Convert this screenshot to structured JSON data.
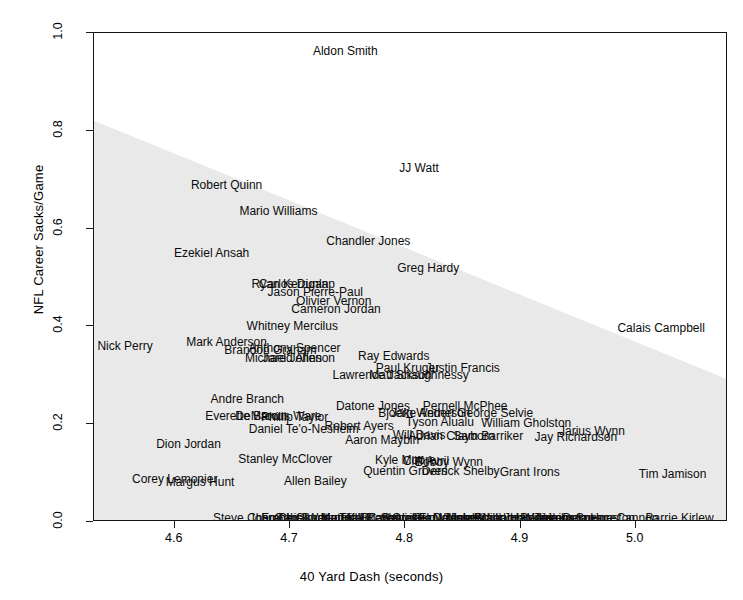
{
  "chart_data": {
    "type": "scatter",
    "title": "",
    "xlabel": "40 Yard Dash (seconds)",
    "ylabel": "NFL Career Sacks/Game",
    "xlim": [
      4.53,
      5.08
    ],
    "ylim": [
      0.0,
      1.0
    ],
    "xticks": [
      "4.6",
      "4.7",
      "4.8",
      "4.9",
      "5.0"
    ],
    "xtick_values": [
      4.6,
      4.7,
      4.8,
      4.9,
      5.0
    ],
    "yticks": [
      "0.0",
      "0.2",
      "0.4",
      "0.6",
      "0.8",
      "1.0"
    ],
    "ytick_values": [
      0.0,
      0.2,
      0.4,
      0.6,
      0.8,
      1.0
    ],
    "grid": false,
    "legend": "none",
    "marker_style": "text-labels",
    "shaded_region": {
      "description": "light grey triangular density/convex-hull shading under a descending boundary",
      "color": "#e9e9e9",
      "boundary_points": [
        [
          4.53,
          0.82
        ],
        [
          5.08,
          0.29
        ],
        [
          5.08,
          0.0
        ],
        [
          4.53,
          0.0
        ]
      ]
    },
    "points": [
      {
        "label": "Aldon Smith",
        "x": 4.748,
        "y": 0.963
      },
      {
        "label": "JJ Watt",
        "x": 4.812,
        "y": 0.723
      },
      {
        "label": "Robert Quinn",
        "x": 4.645,
        "y": 0.69
      },
      {
        "label": "Mario Williams",
        "x": 4.69,
        "y": 0.636
      },
      {
        "label": "Chandler Jones",
        "x": 4.768,
        "y": 0.575
      },
      {
        "label": "Ezekiel Ansah",
        "x": 4.632,
        "y": 0.551
      },
      {
        "label": "Greg Hardy",
        "x": 4.82,
        "y": 0.519
      },
      {
        "label": "Ryan Kerrigan",
        "x": 4.7,
        "y": 0.487
      },
      {
        "label": "Carlos Dunlap",
        "x": 4.706,
        "y": 0.487
      },
      {
        "label": "Jason Pierre-Paul",
        "x": 4.722,
        "y": 0.47
      },
      {
        "label": "Olivier Vernon",
        "x": 4.738,
        "y": 0.452
      },
      {
        "label": "Cameron Jordan",
        "x": 4.74,
        "y": 0.436
      },
      {
        "label": "Whitney Mercilus",
        "x": 4.702,
        "y": 0.4
      },
      {
        "label": "Calais Campbell",
        "x": 5.022,
        "y": 0.397
      },
      {
        "label": "Mark Anderson",
        "x": 4.645,
        "y": 0.369
      },
      {
        "label": "Nick Perry",
        "x": 4.557,
        "y": 0.36
      },
      {
        "label": "Anthony Spencer",
        "x": 4.704,
        "y": 0.356
      },
      {
        "label": "Brandon Graham",
        "x": 4.683,
        "y": 0.351
      },
      {
        "label": "Ray Edwards",
        "x": 4.79,
        "y": 0.34
      },
      {
        "label": "Michael Johnson",
        "x": 4.7,
        "y": 0.336
      },
      {
        "label": "Jared Allen",
        "x": 4.702,
        "y": 0.336
      },
      {
        "label": "Paul Kruger",
        "x": 4.802,
        "y": 0.315
      },
      {
        "label": "Justin Francis",
        "x": 4.85,
        "y": 0.315
      },
      {
        "label": "Lawrence Jackson",
        "x": 4.78,
        "y": 0.3
      },
      {
        "label": "Matt Shaughnessy",
        "x": 4.812,
        "y": 0.3
      },
      {
        "label": "Andre Branch",
        "x": 4.663,
        "y": 0.252
      },
      {
        "label": "Datone Jones",
        "x": 4.772,
        "y": 0.238
      },
      {
        "label": "Pernell McPhee",
        "x": 4.852,
        "y": 0.237
      },
      {
        "label": "Bjoern Werner",
        "x": 4.81,
        "y": 0.222
      },
      {
        "label": "Jake Anderson",
        "x": 4.822,
        "y": 0.222
      },
      {
        "label": "George Selvie",
        "x": 4.878,
        "y": 0.222
      },
      {
        "label": "Everette Brown",
        "x": 4.662,
        "y": 0.216
      },
      {
        "label": "DeMarcus Ware",
        "x": 4.69,
        "y": 0.216
      },
      {
        "label": "Phillip Taylor",
        "x": 4.704,
        "y": 0.214
      },
      {
        "label": "Tyson Alualu",
        "x": 4.83,
        "y": 0.204
      },
      {
        "label": "William Gholston",
        "x": 4.905,
        "y": 0.203
      },
      {
        "label": "Robert Ayers",
        "x": 4.76,
        "y": 0.196
      },
      {
        "label": "Daniel Te'o-Nesheim",
        "x": 4.712,
        "y": 0.19
      },
      {
        "label": "Jarius Wynn",
        "x": 4.962,
        "y": 0.186
      },
      {
        "label": "Will Davis",
        "x": 4.812,
        "y": 0.178
      },
      {
        "label": "Adrian Clayborn",
        "x": 4.84,
        "y": 0.176
      },
      {
        "label": "Sam Barriker",
        "x": 4.872,
        "y": 0.176
      },
      {
        "label": "Jay Richardson",
        "x": 4.948,
        "y": 0.174
      },
      {
        "label": "Aaron Maybin",
        "x": 4.78,
        "y": 0.168
      },
      {
        "label": "Dion Jordan",
        "x": 4.612,
        "y": 0.16
      },
      {
        "label": "Stanley McClover",
        "x": 4.696,
        "y": 0.128
      },
      {
        "label": "Kyle Moore",
        "x": 4.8,
        "y": 0.126
      },
      {
        "label": "Cliff Avril",
        "x": 4.818,
        "y": 0.124
      },
      {
        "label": "Bobby Wynn",
        "x": 4.838,
        "y": 0.122
      },
      {
        "label": "Quentin Groves",
        "x": 4.8,
        "y": 0.104
      },
      {
        "label": "Derrick Shelby",
        "x": 4.848,
        "y": 0.104
      },
      {
        "label": "Grant Irons",
        "x": 4.908,
        "y": 0.102
      },
      {
        "label": "Tim Jamison",
        "x": 5.032,
        "y": 0.098
      },
      {
        "label": "Corey Lemonier",
        "x": 4.6,
        "y": 0.088
      },
      {
        "label": "Margus Hunt",
        "x": 4.622,
        "y": 0.082
      },
      {
        "label": "Allen Bailey",
        "x": 4.722,
        "y": 0.084
      },
      {
        "label": "Steve Chambers",
        "x": 4.672,
        "y": 0.008
      },
      {
        "label": "John Chick",
        "x": 4.69,
        "y": 0.008
      },
      {
        "label": "Frank Okam",
        "x": 4.704,
        "y": 0.008
      },
      {
        "label": "Gabe Watson",
        "x": 4.718,
        "y": 0.008
      },
      {
        "label": "Jordan Hill",
        "x": 4.734,
        "y": 0.008
      },
      {
        "label": "Matt Kalil",
        "x": 4.748,
        "y": 0.008
      },
      {
        "label": "Kendall Reyes",
        "x": 4.762,
        "y": 0.008
      },
      {
        "label": "Tank Carradine",
        "x": 4.778,
        "y": 0.008
      },
      {
        "label": "Brian Orakpo",
        "x": 4.792,
        "y": 0.008
      },
      {
        "label": "Sharrif Floyd",
        "x": 4.808,
        "y": 0.008
      },
      {
        "label": "Sylvester Williams",
        "x": 4.822,
        "y": 0.008
      },
      {
        "label": "Star Lotulelei",
        "x": 4.838,
        "y": 0.008
      },
      {
        "label": "Datone Scott",
        "x": 4.854,
        "y": 0.008
      },
      {
        "label": "Jesse Williams",
        "x": 4.868,
        "y": 0.008
      },
      {
        "label": "Johnathan Hankins",
        "x": 4.884,
        "y": 0.008
      },
      {
        "label": "Brandon Williams",
        "x": 4.9,
        "y": 0.008
      },
      {
        "label": "John Jenkins",
        "x": 4.916,
        "y": 0.008
      },
      {
        "label": "Bennie Logan",
        "x": 4.932,
        "y": 0.008
      },
      {
        "label": "Akeem Spence",
        "x": 4.948,
        "y": 0.008
      },
      {
        "label": "Lamarr Houston",
        "x": 4.962,
        "y": 0.008
      },
      {
        "label": "Delaware Cannon",
        "x": 4.978,
        "y": 0.008
      },
      {
        "label": "Barrie Kirlew",
        "x": 5.038,
        "y": 0.008
      }
    ]
  }
}
